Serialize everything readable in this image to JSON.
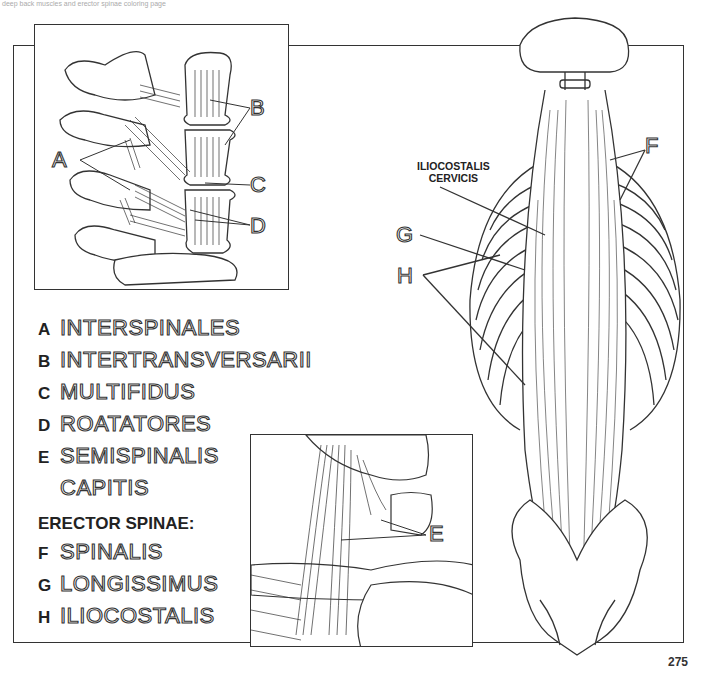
{
  "page": {
    "number": "275",
    "header_fragment": "deep back muscles and erector spinae coloring page"
  },
  "legend": {
    "items": [
      {
        "letter": "A",
        "name": "INTERSPINALES"
      },
      {
        "letter": "B",
        "name": "INTERTRANSVERSARII"
      },
      {
        "letter": "C",
        "name": "MULTIFIDUS"
      },
      {
        "letter": "D",
        "name": "ROATATORES"
      },
      {
        "letter": "E",
        "name": "SEMISPINALIS",
        "name_line2": "CAPITIS"
      }
    ],
    "group_heading": "ERECTOR SPINAE:",
    "group_items": [
      {
        "letter": "F",
        "name": "SPINALIS"
      },
      {
        "letter": "G",
        "name": "LONGISSIMUS"
      },
      {
        "letter": "H",
        "name": "ILIOCOSTALIS"
      }
    ]
  },
  "figures": {
    "vertebrae_inset": {
      "callouts": [
        "A",
        "B",
        "C",
        "D"
      ]
    },
    "neck_inset": {
      "callouts": [
        "E"
      ]
    },
    "posterior_view": {
      "callouts": [
        "F",
        "G",
        "H"
      ],
      "annotation": {
        "line1": "ILIOCOSTALIS",
        "line2": "CERVICIS"
      }
    }
  },
  "colors": {
    "line": "#333333",
    "background": "#ffffff"
  }
}
